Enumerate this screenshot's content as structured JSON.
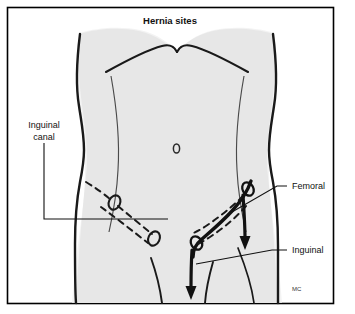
{
  "figure": {
    "title": "Hernia sites",
    "signature": "MC",
    "frame_color": "#000000",
    "background_color": "#ffffff",
    "body_fill_color": "#e7e7e7",
    "outline_color": "#1a1a1a"
  },
  "labels": {
    "inguinal_canal_line1": "Inguinal",
    "inguinal_canal_line2": "canal",
    "femoral": "Femoral",
    "inguinal": "Inguinal"
  },
  "anatomy": {
    "navel": "0",
    "canal_style_left": "dashed",
    "canal_style_right": "dashed",
    "ligament_style_right": "solid",
    "ring_shape": "oval",
    "arrow_count": 2
  }
}
